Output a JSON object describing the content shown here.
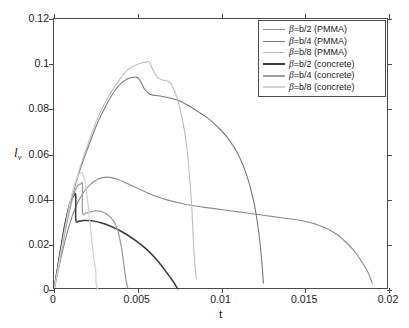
{
  "chart_data": {
    "type": "line",
    "title": "",
    "xlabel": "t",
    "ylabel": "l_v",
    "xlim": [
      0,
      0.02
    ],
    "ylim": [
      0,
      0.12
    ],
    "grid": false,
    "legend_position": "top-right",
    "xticks": [
      "0",
      "0.005",
      "0.01",
      "0.015",
      "0.02"
    ],
    "xtick_values": [
      0,
      0.005,
      0.01,
      0.015,
      0.02
    ],
    "yticks": [
      "0",
      "0.02",
      "0.04",
      "0.06",
      "0.08",
      "0.1",
      "0.12"
    ],
    "ytick_values": [
      0,
      0.02,
      0.04,
      0.06,
      0.08,
      0.1,
      0.12
    ],
    "series": [
      {
        "name": "beta=b/2 (PMMA)",
        "legend_label": "β=b/2 (PMMA)",
        "color": "#8c8c8c",
        "width": 1.1,
        "x": [
          0.0,
          0.0003,
          0.0007,
          0.0011,
          0.0015,
          0.002,
          0.0026,
          0.0032,
          0.0038,
          0.0044,
          0.005,
          0.0056,
          0.0062,
          0.0068,
          0.0075,
          0.0082,
          0.009,
          0.0098,
          0.0106,
          0.0114,
          0.0122,
          0.013,
          0.0138,
          0.0146,
          0.0152,
          0.0158,
          0.0164,
          0.017,
          0.0175,
          0.018,
          0.0184,
          0.0187,
          0.0189,
          0.019
        ],
        "y": [
          0.0,
          0.0105,
          0.023,
          0.033,
          0.04,
          0.0455,
          0.049,
          0.05,
          0.049,
          0.047,
          0.045,
          0.043,
          0.0412,
          0.0398,
          0.0385,
          0.0375,
          0.0366,
          0.0358,
          0.035,
          0.0342,
          0.0334,
          0.0326,
          0.0318,
          0.031,
          0.03,
          0.0287,
          0.0268,
          0.024,
          0.0207,
          0.0166,
          0.0122,
          0.0085,
          0.005,
          0.003
        ]
      },
      {
        "name": "beta=b/4 (PMMA)",
        "legend_label": "β=b/4 (PMMA)",
        "color": "#787878",
        "width": 1.1,
        "x": [
          0.0,
          0.0003,
          0.0007,
          0.0011,
          0.0015,
          0.002,
          0.0026,
          0.0032,
          0.0038,
          0.0044,
          0.005,
          0.0054,
          0.0057,
          0.006,
          0.0064,
          0.0068,
          0.0074,
          0.008,
          0.0086,
          0.0092,
          0.0098,
          0.0104,
          0.011,
          0.0115,
          0.0119,
          0.0122,
          0.0124,
          0.0125
        ],
        "y": [
          0.0,
          0.0135,
          0.03,
          0.042,
          0.052,
          0.0625,
          0.074,
          0.083,
          0.09,
          0.0935,
          0.094,
          0.089,
          0.0868,
          0.0862,
          0.0858,
          0.0852,
          0.084,
          0.0818,
          0.079,
          0.076,
          0.072,
          0.067,
          0.06,
          0.051,
          0.04,
          0.027,
          0.013,
          0.003
        ]
      },
      {
        "name": "beta=b/8 (PMMA)",
        "legend_label": "β=b/8 (PMMA)",
        "color": "#bdbdbd",
        "width": 1.1,
        "x": [
          0.0,
          0.0003,
          0.0007,
          0.0011,
          0.0015,
          0.002,
          0.0026,
          0.0032,
          0.0038,
          0.0044,
          0.005,
          0.0054,
          0.0057,
          0.0059,
          0.0062,
          0.0065,
          0.0069,
          0.0072,
          0.0075,
          0.0078,
          0.008,
          0.0082,
          0.0083,
          0.0084,
          0.0085
        ],
        "y": [
          0.0,
          0.014,
          0.031,
          0.043,
          0.053,
          0.064,
          0.076,
          0.085,
          0.092,
          0.0975,
          0.1,
          0.1008,
          0.101,
          0.0975,
          0.094,
          0.093,
          0.092,
          0.088,
          0.081,
          0.07,
          0.058,
          0.04,
          0.025,
          0.012,
          0.005
        ]
      },
      {
        "name": "beta=b/2 (concrete)",
        "legend_label": "β=b/2 (concrete)",
        "color": "#3a3a3a",
        "width": 1.5,
        "x": [
          0.0,
          0.0002,
          0.0004,
          0.0006,
          0.0008,
          0.001,
          0.0012,
          0.0013,
          0.0013,
          0.0015,
          0.0017,
          0.002,
          0.0024,
          0.0028,
          0.0032,
          0.0036,
          0.004,
          0.0045,
          0.005,
          0.0055,
          0.006,
          0.0064,
          0.0067,
          0.007,
          0.0072,
          0.0073,
          0.0074
        ],
        "y": [
          0.0,
          0.009,
          0.018,
          0.027,
          0.034,
          0.0395,
          0.042,
          0.0418,
          0.031,
          0.0305,
          0.0307,
          0.0308,
          0.0305,
          0.0298,
          0.0288,
          0.0275,
          0.026,
          0.0238,
          0.0212,
          0.0182,
          0.0145,
          0.011,
          0.008,
          0.005,
          0.0028,
          0.0015,
          0.0005
        ]
      },
      {
        "name": "beta=b/4 (concrete)",
        "legend_label": "β=b/4 (concrete)",
        "color": "#9e9e9e",
        "width": 1.3,
        "x": [
          0.0,
          0.0002,
          0.0004,
          0.0006,
          0.0008,
          0.001,
          0.0012,
          0.0014,
          0.0016,
          0.0017,
          0.0017,
          0.0019,
          0.0022,
          0.0025,
          0.0028,
          0.0031,
          0.0034,
          0.0036,
          0.0038,
          0.004,
          0.0041,
          0.0042,
          0.0043,
          0.0044
        ],
        "y": [
          0.0,
          0.0075,
          0.0155,
          0.0235,
          0.031,
          0.0375,
          0.043,
          0.046,
          0.047,
          0.0465,
          0.0345,
          0.034,
          0.0346,
          0.035,
          0.0348,
          0.0338,
          0.032,
          0.03,
          0.0265,
          0.02,
          0.015,
          0.0095,
          0.0045,
          0.001
        ]
      },
      {
        "name": "beta=b/8 (concrete)",
        "legend_label": "β=b/8 (concrete)",
        "color": "#d4d4d4",
        "width": 1.3,
        "x": [
          0.0,
          0.0002,
          0.0004,
          0.0006,
          0.0008,
          0.001,
          0.0012,
          0.0014,
          0.0016,
          0.0018,
          0.0019,
          0.002,
          0.0021,
          0.0022,
          0.0023,
          0.0024,
          0.0025,
          0.0025,
          0.0026
        ],
        "y": [
          0.0,
          0.008,
          0.0165,
          0.025,
          0.033,
          0.04,
          0.046,
          0.05,
          0.052,
          0.05,
          0.046,
          0.04,
          0.033,
          0.026,
          0.019,
          0.013,
          0.0075,
          0.0035,
          0.0005
        ]
      }
    ]
  },
  "axes": {
    "x_title": "t",
    "y_title_main": "l",
    "y_title_sub": "v"
  },
  "legend": {
    "entries": [
      {
        "label": "β=b/2 (PMMA)",
        "color": "#8c8c8c"
      },
      {
        "label": "β=b/4 (PMMA)",
        "color": "#787878"
      },
      {
        "label": "β=b/8 (PMMA)",
        "color": "#bdbdbd"
      },
      {
        "label": "β=b/2 (concrete)",
        "color": "#3a3a3a"
      },
      {
        "label": "β=b/4 (concrete)",
        "color": "#9e9e9e"
      },
      {
        "label": "β=b/8 (concrete)",
        "color": "#d4d4d4"
      }
    ]
  }
}
